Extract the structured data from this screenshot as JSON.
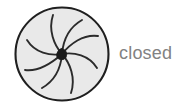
{
  "figure": {
    "name": "iris-diaphragm-closed",
    "label": "closed",
    "label_color": "#828282",
    "colors": {
      "blade_fill": "#e9e9e9",
      "blade_stroke": "#2b2b2b",
      "ring_stroke": "#1f1f1f",
      "hub_fill": "#1a1a1a",
      "background": "#ffffff"
    },
    "geometry": {
      "center_x": 62,
      "center_y": 54,
      "outer_radius": 47,
      "hub_radius": 4,
      "blade_count": 8,
      "state": "closed",
      "aperture_opening": 0
    }
  }
}
